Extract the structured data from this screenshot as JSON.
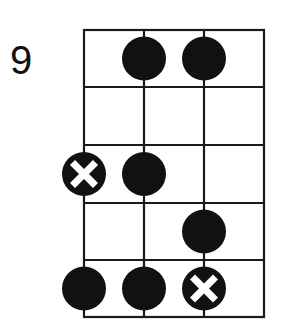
{
  "diagram": {
    "type": "fretboard-scale-diagram",
    "starting_fret": "9",
    "strings": 4,
    "frets": 5,
    "colors": {
      "line": "#1a1a1a",
      "dot": "#111111",
      "marker_x": "#ffffff",
      "background": "#ffffff"
    },
    "notes": [
      {
        "string": 2,
        "fret": 1,
        "type": "dot"
      },
      {
        "string": 3,
        "fret": 1,
        "type": "dot"
      },
      {
        "string": 1,
        "fret": 3,
        "type": "root-x"
      },
      {
        "string": 2,
        "fret": 3,
        "type": "dot"
      },
      {
        "string": 3,
        "fret": 4,
        "type": "dot"
      },
      {
        "string": 1,
        "fret": 5,
        "type": "dot"
      },
      {
        "string": 2,
        "fret": 5,
        "type": "dot"
      },
      {
        "string": 3,
        "fret": 5,
        "type": "root-x"
      }
    ]
  }
}
